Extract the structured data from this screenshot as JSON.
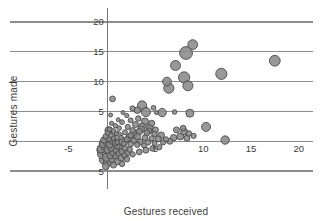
{
  "chart_data": {
    "type": "scatter",
    "title": "",
    "xlabel": "Gestures received",
    "ylabel": "Gestures made",
    "xlim": [
      -5,
      21.5
    ],
    "ylim": [
      -6,
      21
    ],
    "grid": true,
    "legend": null,
    "xticks": [
      -5,
      5,
      10,
      15,
      20
    ],
    "xtick_labels": [
      "-5",
      "5",
      "10",
      "15",
      "20"
    ],
    "yticks": [
      -5,
      5,
      10,
      15,
      20
    ],
    "ytick_labels": [
      "5",
      "5",
      "10",
      "15",
      "20"
    ],
    "gridlines_y": [
      20,
      15,
      10,
      5,
      0,
      -5
    ],
    "point_color": "#8a8a8a",
    "point_edge_color": "#4a4a4a",
    "grid_color": "#8d8d8d",
    "background_color": "#ffffff",
    "note": "Bubble scatter; marker area varies by weight. Dense overlapping cluster at origin.",
    "points": [
      {
        "x": 17.5,
        "y": 13.5,
        "r": 5.4
      },
      {
        "x": 8.9,
        "y": 16.2,
        "r": 4.9
      },
      {
        "x": 8.2,
        "y": 14.8,
        "r": 6.4
      },
      {
        "x": 7.1,
        "y": 12.7,
        "r": 5.0
      },
      {
        "x": 11.9,
        "y": 11.3,
        "r": 5.6
      },
      {
        "x": 8.0,
        "y": 10.7,
        "r": 5.6
      },
      {
        "x": 6.2,
        "y": 10.0,
        "r": 4.4
      },
      {
        "x": 6.4,
        "y": 8.9,
        "r": 5.1
      },
      {
        "x": 8.4,
        "y": 9.3,
        "r": 5.0
      },
      {
        "x": 0.5,
        "y": 7.1,
        "r": 2.9
      },
      {
        "x": 3.6,
        "y": 6.0,
        "r": 4.6
      },
      {
        "x": 2.6,
        "y": 5.5,
        "r": 2.6
      },
      {
        "x": 3.1,
        "y": 5.2,
        "r": 3.3
      },
      {
        "x": 4.0,
        "y": 4.9,
        "r": 4.6
      },
      {
        "x": 5.7,
        "y": 4.8,
        "r": 4.2
      },
      {
        "x": 7.0,
        "y": 4.9,
        "r": 2.3
      },
      {
        "x": 8.6,
        "y": 4.7,
        "r": 4.0
      },
      {
        "x": 1.6,
        "y": 4.8,
        "r": 2.0
      },
      {
        "x": 0.3,
        "y": 4.4,
        "r": 2.0
      },
      {
        "x": 2.0,
        "y": 4.3,
        "r": 2.1
      },
      {
        "x": 10.3,
        "y": 2.4,
        "r": 4.5
      },
      {
        "x": 3.2,
        "y": 3.8,
        "r": 2.8
      },
      {
        "x": 2.4,
        "y": 3.5,
        "r": 2.5
      },
      {
        "x": 3.9,
        "y": 3.3,
        "r": 3.6
      },
      {
        "x": 4.6,
        "y": 3.0,
        "r": 3.1
      },
      {
        "x": 1.5,
        "y": 3.2,
        "r": 2.4
      },
      {
        "x": 2.9,
        "y": 2.8,
        "r": 3.0
      },
      {
        "x": 3.6,
        "y": 2.5,
        "r": 3.4
      },
      {
        "x": 4.4,
        "y": 2.2,
        "r": 3.7
      },
      {
        "x": 5.0,
        "y": 1.9,
        "r": 3.0
      },
      {
        "x": 2.1,
        "y": 2.4,
        "r": 2.6
      },
      {
        "x": 1.2,
        "y": 2.2,
        "r": 2.3
      },
      {
        "x": 2.6,
        "y": 1.8,
        "r": 2.9
      },
      {
        "x": 3.3,
        "y": 1.6,
        "r": 3.2
      },
      {
        "x": 4.1,
        "y": 1.4,
        "r": 3.0
      },
      {
        "x": 4.9,
        "y": 1.2,
        "r": 2.7
      },
      {
        "x": 5.6,
        "y": 1.0,
        "r": 3.3
      },
      {
        "x": 1.8,
        "y": 1.5,
        "r": 2.5
      },
      {
        "x": 0.9,
        "y": 1.3,
        "r": 2.2
      },
      {
        "x": 2.4,
        "y": 1.0,
        "r": 2.8
      },
      {
        "x": 3.1,
        "y": 0.8,
        "r": 3.1
      },
      {
        "x": 3.9,
        "y": 0.6,
        "r": 2.9
      },
      {
        "x": 4.6,
        "y": 0.5,
        "r": 2.6
      },
      {
        "x": 5.3,
        "y": 0.4,
        "r": 3.0
      },
      {
        "x": 6.1,
        "y": 0.3,
        "r": 2.7
      },
      {
        "x": 6.9,
        "y": 0.6,
        "r": 3.2
      },
      {
        "x": 7.6,
        "y": 0.8,
        "r": 3.5
      },
      {
        "x": 8.3,
        "y": 0.5,
        "r": 3.0
      },
      {
        "x": 8.0,
        "y": 1.6,
        "r": 3.4
      },
      {
        "x": 8.5,
        "y": 1.3,
        "r": 2.8
      },
      {
        "x": 12.3,
        "y": 0.2,
        "r": 4.2
      },
      {
        "x": 6.5,
        "y": 0.0,
        "r": 3.0
      },
      {
        "x": 5.8,
        "y": -0.2,
        "r": 2.6
      },
      {
        "x": 1.4,
        "y": 0.6,
        "r": 2.4
      },
      {
        "x": 0.6,
        "y": 0.5,
        "r": 2.2
      },
      {
        "x": 2.0,
        "y": 0.3,
        "r": 2.7
      },
      {
        "x": 2.7,
        "y": 0.1,
        "r": 2.9
      },
      {
        "x": 3.4,
        "y": -0.1,
        "r": 3.0
      },
      {
        "x": 4.2,
        "y": -0.2,
        "r": 2.8
      },
      {
        "x": 4.9,
        "y": -0.3,
        "r": 2.5
      },
      {
        "x": 1.0,
        "y": -0.2,
        "r": 2.3
      },
      {
        "x": 1.7,
        "y": -0.4,
        "r": 2.6
      },
      {
        "x": 2.4,
        "y": -0.5,
        "r": 2.8
      },
      {
        "x": 3.1,
        "y": -0.6,
        "r": 2.7
      },
      {
        "x": 3.8,
        "y": -0.7,
        "r": 2.5
      },
      {
        "x": 0.4,
        "y": 3.0,
        "r": 2.1
      },
      {
        "x": 0.8,
        "y": 2.6,
        "r": 2.2
      },
      {
        "x": 1.1,
        "y": 3.6,
        "r": 2.0
      },
      {
        "x": 0.2,
        "y": 2.0,
        "r": 2.4
      },
      {
        "x": 0.6,
        "y": 1.7,
        "r": 2.5
      },
      {
        "x": 0.0,
        "y": 1.4,
        "r": 2.6
      },
      {
        "x": 0.3,
        "y": 1.0,
        "r": 2.7
      },
      {
        "x": -0.2,
        "y": 0.8,
        "r": 2.8
      },
      {
        "x": 0.1,
        "y": 0.4,
        "r": 3.0
      },
      {
        "x": -0.4,
        "y": 0.2,
        "r": 3.2
      },
      {
        "x": 0.5,
        "y": 0.0,
        "r": 3.1
      },
      {
        "x": -0.1,
        "y": -0.2,
        "r": 3.4
      },
      {
        "x": 0.8,
        "y": -0.3,
        "r": 2.9
      },
      {
        "x": -0.5,
        "y": -0.5,
        "r": 3.6
      },
      {
        "x": 0.2,
        "y": -0.6,
        "r": 3.3
      },
      {
        "x": 1.0,
        "y": -0.8,
        "r": 3.0
      },
      {
        "x": -0.3,
        "y": -0.9,
        "r": 3.8
      },
      {
        "x": 0.4,
        "y": -1.1,
        "r": 3.5
      },
      {
        "x": 1.3,
        "y": -1.0,
        "r": 3.1
      },
      {
        "x": -0.7,
        "y": -1.3,
        "r": 4.0
      },
      {
        "x": 0.0,
        "y": -1.4,
        "r": 3.7
      },
      {
        "x": 0.9,
        "y": -1.5,
        "r": 3.2
      },
      {
        "x": 1.8,
        "y": -1.2,
        "r": 2.9
      },
      {
        "x": -0.2,
        "y": -1.8,
        "r": 4.2
      },
      {
        "x": 0.6,
        "y": -1.9,
        "r": 3.6
      },
      {
        "x": 1.5,
        "y": -1.7,
        "r": 3.0
      },
      {
        "x": 2.3,
        "y": -1.4,
        "r": 2.8
      },
      {
        "x": -0.6,
        "y": -2.2,
        "r": 4.4
      },
      {
        "x": 0.3,
        "y": -2.3,
        "r": 3.8
      },
      {
        "x": 1.2,
        "y": -2.1,
        "r": 3.2
      },
      {
        "x": 2.1,
        "y": -1.9,
        "r": 2.9
      },
      {
        "x": -0.1,
        "y": -2.7,
        "r": 4.1
      },
      {
        "x": 0.9,
        "y": -2.6,
        "r": 3.5
      },
      {
        "x": 1.8,
        "y": -2.4,
        "r": 3.0
      },
      {
        "x": -0.4,
        "y": -3.1,
        "r": 4.6
      },
      {
        "x": 0.5,
        "y": -3.0,
        "r": 3.9
      },
      {
        "x": 1.4,
        "y": -2.8,
        "r": 3.1
      },
      {
        "x": 2.6,
        "y": -2.2,
        "r": 2.7
      },
      {
        "x": 3.3,
        "y": -1.8,
        "r": 2.9
      },
      {
        "x": 4.0,
        "y": -1.5,
        "r": 3.0
      },
      {
        "x": 4.7,
        "y": -1.2,
        "r": 2.8
      },
      {
        "x": 5.4,
        "y": -1.0,
        "r": 2.6
      },
      {
        "x": 0.0,
        "y": -3.5,
        "r": 4.3
      },
      {
        "x": 1.0,
        "y": -3.4,
        "r": 3.4
      },
      {
        "x": 2.0,
        "y": -3.0,
        "r": 2.9
      },
      {
        "x": 0.4,
        "y": -1.0,
        "r": 5.0
      },
      {
        "x": -0.3,
        "y": -0.4,
        "r": 5.6
      },
      {
        "x": 0.2,
        "y": -2.0,
        "r": 5.2
      },
      {
        "x": -0.5,
        "y": -1.5,
        "r": 6.0
      },
      {
        "x": 0.7,
        "y": -0.6,
        "r": 4.8
      },
      {
        "x": 1.6,
        "y": -0.1,
        "r": 4.4
      },
      {
        "x": 2.3,
        "y": 0.6,
        "r": 4.0
      },
      {
        "x": 1.1,
        "y": 0.9,
        "r": 4.2
      },
      {
        "x": 0.1,
        "y": 1.8,
        "r": 3.8
      },
      {
        "x": 2.8,
        "y": 1.3,
        "r": 3.6
      },
      {
        "x": 3.5,
        "y": 2.0,
        "r": 3.4
      },
      {
        "x": 4.3,
        "y": 1.7,
        "r": 3.2
      },
      {
        "x": 0.6,
        "y": -4.0,
        "r": 3.0
      },
      {
        "x": -0.2,
        "y": -4.2,
        "r": 3.4
      },
      {
        "x": 1.5,
        "y": -3.8,
        "r": 2.7
      },
      {
        "x": 7.2,
        "y": 1.9,
        "r": 3.0
      },
      {
        "x": 7.9,
        "y": 2.2,
        "r": 2.8
      },
      {
        "x": 9.0,
        "y": 0.9,
        "r": 2.6
      },
      {
        "x": 5.1,
        "y": 4.8,
        "r": 2.0
      },
      {
        "x": 4.8,
        "y": 5.6,
        "r": 2.4
      }
    ]
  }
}
